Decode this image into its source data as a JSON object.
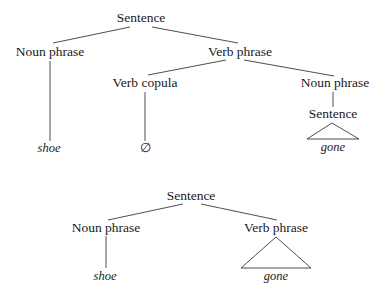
{
  "tree_top": {
    "root": "Sentence",
    "noun_phrase": "Noun phrase",
    "verb_phrase": "Verb phrase",
    "verb_copula": "Verb copula",
    "noun_phrase_2": "Noun phrase",
    "sentence_embedded": "Sentence",
    "leaf_shoe": "shoe",
    "leaf_null": "∅",
    "leaf_gone": "gone"
  },
  "tree_bottom": {
    "root": "Sentence",
    "noun_phrase": "Noun phrase",
    "verb_phrase": "Verb phrase",
    "leaf_shoe": "shoe",
    "leaf_gone": "gone"
  },
  "colors": {
    "line": "#3a3a3a",
    "text": "#1a1a1a",
    "background": "#ffffff"
  }
}
